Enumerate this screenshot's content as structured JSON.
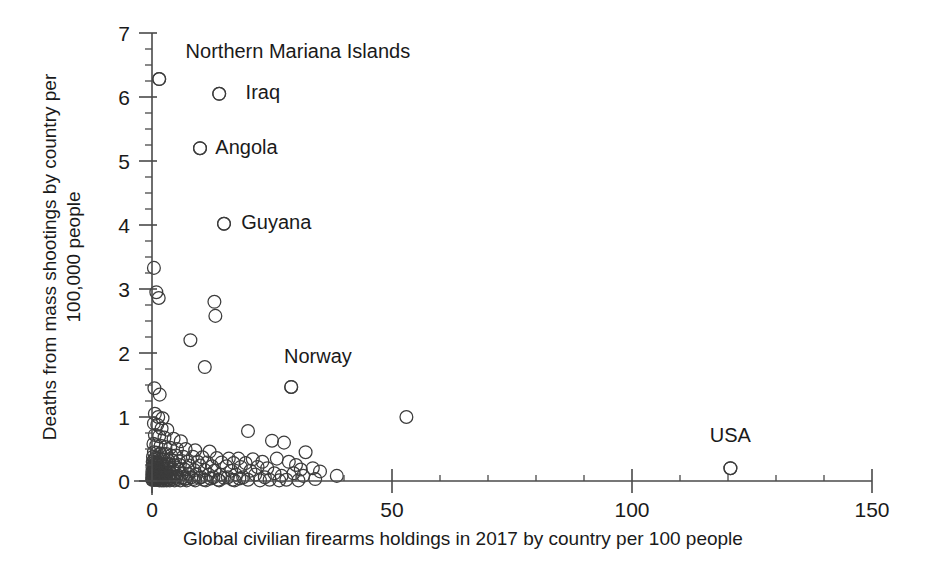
{
  "chart_data": {
    "type": "scatter",
    "title": "",
    "xlabel": "Global civilian firearms holdings in 2017 by country per 100 people",
    "ylabel": "Deaths from mass shootings by country per 100,000 people",
    "xlim": [
      0,
      150
    ],
    "ylim": [
      0,
      7
    ],
    "x_major_ticks": [
      0,
      50,
      100,
      150
    ],
    "x_tick_labels": [
      "0",
      "50",
      "100",
      "150"
    ],
    "x_minor_step": 10,
    "y_major_ticks": [
      0,
      1,
      2,
      3,
      4,
      5,
      6,
      7
    ],
    "y_tick_labels": [
      "0",
      "1",
      "2",
      "3",
      "4",
      "5",
      "6",
      "7"
    ],
    "y_minor_step": 0.25,
    "grid": false,
    "legend": "none",
    "marker": "open-circle",
    "marker_color": "#3c3c3c",
    "annotations": [
      {
        "label": "Northern Mariana Islands",
        "x": 1.5,
        "y": 6.28,
        "label_x": 7.0,
        "label_y": 6.72,
        "anchor": "start"
      },
      {
        "label": "Iraq",
        "x": 14.0,
        "y": 6.05,
        "label_x": 19.5,
        "label_y": 6.08,
        "anchor": "start"
      },
      {
        "label": "Angola",
        "x": 10.0,
        "y": 5.2,
        "label_x": 13.2,
        "label_y": 5.22,
        "anchor": "start"
      },
      {
        "label": "Guyana",
        "x": 15.0,
        "y": 4.02,
        "label_x": 18.6,
        "label_y": 4.04,
        "anchor": "start"
      },
      {
        "label": "Norway",
        "x": 29.0,
        "y": 1.47,
        "label_x": 27.5,
        "label_y": 1.95,
        "anchor": "start"
      },
      {
        "label": "USA",
        "x": 120.5,
        "y": 0.2,
        "label_x": 120.5,
        "label_y": 0.72,
        "anchor": "middle"
      }
    ],
    "points": [
      [
        1.5,
        6.28
      ],
      [
        14.0,
        6.05
      ],
      [
        10.0,
        5.2
      ],
      [
        15.0,
        4.02
      ],
      [
        0.4,
        3.33
      ],
      [
        0.9,
        2.95
      ],
      [
        1.4,
        2.86
      ],
      [
        13.0,
        2.8
      ],
      [
        13.2,
        2.58
      ],
      [
        8.0,
        2.2
      ],
      [
        11.0,
        1.78
      ],
      [
        29.0,
        1.47
      ],
      [
        0.5,
        1.45
      ],
      [
        1.6,
        1.35
      ],
      [
        0.6,
        1.05
      ],
      [
        1.3,
        1.0
      ],
      [
        2.2,
        0.98
      ],
      [
        53.0,
        1.0
      ],
      [
        0.4,
        0.9
      ],
      [
        1.1,
        0.88
      ],
      [
        2.0,
        0.82
      ],
      [
        3.2,
        0.8
      ],
      [
        20.0,
        0.78
      ],
      [
        0.6,
        0.72
      ],
      [
        1.5,
        0.7
      ],
      [
        2.6,
        0.68
      ],
      [
        4.5,
        0.66
      ],
      [
        6.0,
        0.62
      ],
      [
        25.0,
        0.63
      ],
      [
        27.5,
        0.6
      ],
      [
        0.3,
        0.58
      ],
      [
        0.9,
        0.56
      ],
      [
        1.8,
        0.55
      ],
      [
        2.8,
        0.53
      ],
      [
        3.8,
        0.52
      ],
      [
        5.2,
        0.5
      ],
      [
        7.0,
        0.5
      ],
      [
        9.0,
        0.48
      ],
      [
        12.0,
        0.46
      ],
      [
        0.4,
        0.45
      ],
      [
        1.0,
        0.44
      ],
      [
        1.7,
        0.43
      ],
      [
        2.4,
        0.42
      ],
      [
        3.0,
        0.42
      ],
      [
        4.0,
        0.4
      ],
      [
        5.0,
        0.4
      ],
      [
        6.5,
        0.38
      ],
      [
        8.5,
        0.38
      ],
      [
        10.5,
        0.37
      ],
      [
        13.5,
        0.36
      ],
      [
        16.0,
        0.35
      ],
      [
        18.0,
        0.35
      ],
      [
        21.0,
        0.34
      ],
      [
        0.2,
        0.38
      ],
      [
        0.7,
        0.36
      ],
      [
        1.2,
        0.35
      ],
      [
        1.9,
        0.34
      ],
      [
        2.5,
        0.33
      ],
      [
        3.4,
        0.32
      ],
      [
        4.3,
        0.32
      ],
      [
        5.6,
        0.31
      ],
      [
        7.4,
        0.3
      ],
      [
        9.5,
        0.3
      ],
      [
        11.5,
        0.29
      ],
      [
        14.5,
        0.29
      ],
      [
        17.0,
        0.28
      ],
      [
        19.5,
        0.28
      ],
      [
        23.0,
        0.3
      ],
      [
        26.0,
        0.35
      ],
      [
        28.5,
        0.3
      ],
      [
        0.15,
        0.3
      ],
      [
        0.5,
        0.29
      ],
      [
        0.95,
        0.28
      ],
      [
        1.45,
        0.28
      ],
      [
        2.1,
        0.27
      ],
      [
        2.9,
        0.26
      ],
      [
        3.6,
        0.26
      ],
      [
        4.6,
        0.25
      ],
      [
        5.8,
        0.25
      ],
      [
        7.8,
        0.24
      ],
      [
        10.0,
        0.24
      ],
      [
        12.5,
        0.23
      ],
      [
        15.5,
        0.23
      ],
      [
        18.5,
        0.22
      ],
      [
        22.0,
        0.22
      ],
      [
        30.0,
        0.25
      ],
      [
        32.0,
        0.45
      ],
      [
        120.5,
        0.2
      ],
      [
        0.1,
        0.22
      ],
      [
        0.45,
        0.21
      ],
      [
        0.85,
        0.21
      ],
      [
        1.35,
        0.2
      ],
      [
        1.95,
        0.2
      ],
      [
        2.7,
        0.19
      ],
      [
        3.5,
        0.19
      ],
      [
        4.4,
        0.18
      ],
      [
        5.5,
        0.18
      ],
      [
        6.8,
        0.18
      ],
      [
        8.8,
        0.17
      ],
      [
        11.0,
        0.17
      ],
      [
        13.0,
        0.16
      ],
      [
        16.5,
        0.16
      ],
      [
        20.5,
        0.16
      ],
      [
        24.0,
        0.2
      ],
      [
        31.0,
        0.18
      ],
      [
        33.5,
        0.2
      ],
      [
        0.08,
        0.15
      ],
      [
        0.4,
        0.15
      ],
      [
        0.8,
        0.14
      ],
      [
        1.25,
        0.14
      ],
      [
        1.8,
        0.13
      ],
      [
        2.35,
        0.13
      ],
      [
        3.1,
        0.12
      ],
      [
        3.9,
        0.12
      ],
      [
        4.9,
        0.12
      ],
      [
        6.2,
        0.11
      ],
      [
        7.6,
        0.11
      ],
      [
        9.2,
        0.1
      ],
      [
        11.8,
        0.1
      ],
      [
        14.2,
        0.1
      ],
      [
        17.5,
        0.1
      ],
      [
        21.5,
        0.1
      ],
      [
        25.5,
        0.12
      ],
      [
        29.5,
        0.12
      ],
      [
        35.0,
        0.15
      ],
      [
        0.05,
        0.1
      ],
      [
        0.3,
        0.1
      ],
      [
        0.65,
        0.09
      ],
      [
        1.0,
        0.09
      ],
      [
        1.5,
        0.08
      ],
      [
        2.0,
        0.08
      ],
      [
        2.6,
        0.08
      ],
      [
        3.3,
        0.07
      ],
      [
        4.1,
        0.07
      ],
      [
        5.1,
        0.07
      ],
      [
        6.4,
        0.06
      ],
      [
        8.2,
        0.06
      ],
      [
        10.2,
        0.06
      ],
      [
        12.8,
        0.06
      ],
      [
        15.8,
        0.06
      ],
      [
        19.0,
        0.06
      ],
      [
        23.5,
        0.06
      ],
      [
        27.0,
        0.08
      ],
      [
        31.5,
        0.08
      ],
      [
        38.5,
        0.08
      ],
      [
        0.05,
        0.05
      ],
      [
        0.25,
        0.05
      ],
      [
        0.55,
        0.05
      ],
      [
        0.9,
        0.04
      ],
      [
        1.3,
        0.04
      ],
      [
        1.7,
        0.04
      ],
      [
        2.2,
        0.04
      ],
      [
        2.8,
        0.03
      ],
      [
        3.5,
        0.03
      ],
      [
        4.4,
        0.03
      ],
      [
        5.4,
        0.03
      ],
      [
        6.9,
        0.03
      ],
      [
        8.6,
        0.03
      ],
      [
        10.8,
        0.02
      ],
      [
        13.8,
        0.02
      ],
      [
        16.8,
        0.02
      ],
      [
        20.0,
        0.02
      ],
      [
        24.5,
        0.02
      ],
      [
        28.0,
        0.02
      ],
      [
        34.0,
        0.03
      ],
      [
        0.04,
        0.02
      ],
      [
        0.2,
        0.02
      ],
      [
        0.5,
        0.02
      ],
      [
        0.75,
        0.02
      ],
      [
        1.1,
        0.02
      ],
      [
        1.55,
        0.01
      ],
      [
        2.05,
        0.01
      ],
      [
        2.5,
        0.01
      ],
      [
        3.05,
        0.01
      ],
      [
        3.7,
        0.01
      ],
      [
        4.7,
        0.01
      ],
      [
        5.9,
        0.01
      ],
      [
        7.2,
        0.01
      ],
      [
        9.0,
        0.01
      ],
      [
        11.2,
        0.01
      ],
      [
        14.0,
        0.01
      ],
      [
        17.2,
        0.01
      ],
      [
        22.5,
        0.01
      ],
      [
        26.5,
        0.01
      ],
      [
        30.5,
        0.01
      ],
      [
        0.35,
        0.16
      ],
      [
        0.7,
        0.19
      ],
      [
        1.15,
        0.24
      ],
      [
        1.6,
        0.18
      ],
      [
        2.3,
        0.22
      ],
      [
        0.6,
        0.26
      ],
      [
        1.05,
        0.31
      ],
      [
        0.45,
        0.33
      ],
      [
        0.9,
        0.17
      ],
      [
        1.4,
        0.11
      ],
      [
        0.3,
        0.24
      ],
      [
        0.75,
        0.12
      ],
      [
        1.2,
        0.06
      ],
      [
        0.55,
        0.07
      ],
      [
        0.95,
        0.05
      ],
      [
        18.2,
        0.04
      ],
      [
        15.0,
        0.05
      ],
      [
        12.2,
        0.04
      ],
      [
        9.8,
        0.05
      ],
      [
        7.0,
        0.04
      ],
      [
        5.0,
        0.05
      ],
      [
        3.8,
        0.05
      ],
      [
        2.9,
        0.06
      ],
      [
        2.1,
        0.05
      ],
      [
        1.35,
        0.03
      ]
    ]
  }
}
